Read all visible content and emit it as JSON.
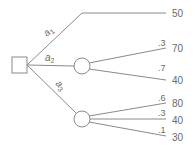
{
  "diagram": {
    "type": "decision-tree",
    "decision_node": {
      "shape": "square"
    },
    "alternatives": [
      {
        "label": "a",
        "subscript": "1",
        "outcomes": [
          {
            "probability": "",
            "payoff": "50"
          }
        ]
      },
      {
        "label": "a",
        "subscript": "2",
        "outcomes": [
          {
            "probability": ".3",
            "payoff": "70"
          },
          {
            "probability": ".7",
            "payoff": "40"
          }
        ]
      },
      {
        "label": "a",
        "subscript": "3",
        "outcomes": [
          {
            "probability": ".6",
            "payoff": "80"
          },
          {
            "probability": ".3",
            "payoff": "40"
          },
          {
            "probability": ".1",
            "payoff": "30"
          }
        ]
      }
    ],
    "colors": {
      "line": "#8a8a8a",
      "text": "#6a6a6a"
    }
  }
}
